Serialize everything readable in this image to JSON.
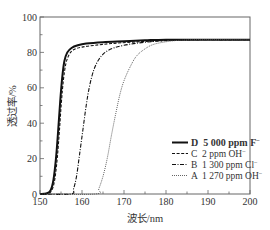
{
  "chart_data": {
    "type": "line",
    "title": "",
    "xlabel": "波长/nm",
    "ylabel": "透过率/%",
    "xlim": [
      150,
      200
    ],
    "ylim": [
      0,
      100
    ],
    "x_ticks": [
      150,
      160,
      170,
      180,
      190,
      200
    ],
    "y_ticks": [
      0,
      20,
      40,
      60,
      80,
      100
    ],
    "x_minor_step": 5,
    "y_minor_step": 10,
    "grid": false,
    "legend_position": "lower right",
    "series": [
      {
        "name": "D  5 000 ppm F⁻",
        "style": "solid",
        "width": 2.0,
        "x": [
          150,
          151.5,
          152.5,
          153.2,
          153.8,
          154.3,
          154.8,
          155.3,
          155.8,
          156.5,
          157.5,
          159,
          161,
          165,
          170,
          175,
          180,
          190,
          200
        ],
        "y": [
          0,
          0.3,
          2,
          8,
          20,
          35,
          52,
          66,
          75,
          80,
          82.5,
          84,
          85,
          85.8,
          86.3,
          86.8,
          87.2,
          87.2,
          87.2
        ]
      },
      {
        "name": "C  2 ppm OH⁻",
        "style": "dashed",
        "width": 1.1,
        "x": [
          150,
          151.8,
          152.8,
          153.5,
          154.1,
          154.6,
          155.1,
          155.6,
          156.2,
          157,
          158,
          160,
          163,
          167,
          172,
          178,
          185,
          200
        ],
        "y": [
          0,
          0.3,
          2,
          8,
          20,
          35,
          52,
          65,
          74,
          79,
          81.5,
          83,
          84,
          85,
          85.8,
          86.5,
          87.2,
          87.2
        ]
      },
      {
        "name": "B  1 300 ppm Cl⁻",
        "style": "dashdot",
        "width": 1.1,
        "x": [
          150,
          157.3,
          158,
          158.7,
          159.4,
          160.2,
          161,
          161.8,
          162.8,
          164,
          165.5,
          167.5,
          170,
          173,
          177,
          182,
          188,
          200
        ],
        "y": [
          0,
          0,
          3,
          10,
          22,
          36,
          50,
          61,
          70,
          76,
          80,
          82.5,
          84,
          85.2,
          86.2,
          86.8,
          87.2,
          87.2
        ]
      },
      {
        "name": "A  1 270 ppm OH⁻",
        "style": "dotted",
        "width": 1.0,
        "x": [
          150,
          163.2,
          164,
          165,
          166,
          167,
          168,
          169,
          170,
          171.5,
          173,
          175,
          177,
          180,
          183,
          188,
          200
        ],
        "y": [
          0,
          0,
          3,
          10,
          20,
          33,
          45,
          56,
          64,
          72,
          78,
          82,
          84.5,
          86,
          86.8,
          87.2,
          87.2
        ]
      }
    ]
  },
  "legend": {
    "items": [
      {
        "label": "D  5 000 ppm F",
        "sup": "−",
        "style": "solid"
      },
      {
        "label": "C  2 ppm OH",
        "sup": "−",
        "style": "dashed"
      },
      {
        "label": "B  1 300 ppm Cl",
        "sup": "−",
        "style": "dashdot"
      },
      {
        "label": "A  1 270 ppm OH",
        "sup": "−",
        "style": "dotted"
      }
    ]
  },
  "colors": {
    "axis": "#666666",
    "line": "#111111",
    "text": "#333333"
  }
}
